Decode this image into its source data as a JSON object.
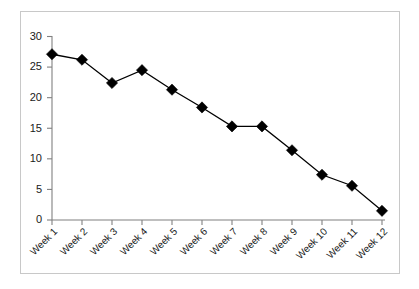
{
  "chart_data": {
    "type": "line",
    "title": "",
    "subtitle": "",
    "xlabel": "",
    "ylabel": "",
    "categories": [
      "Week 1",
      "Week 2",
      "Week 3",
      "Week 4",
      "Week 5",
      "Week 6",
      "Week 7",
      "Week 8",
      "Week 9",
      "Week 10",
      "Week 11",
      "Week 12"
    ],
    "values": [
      27.1,
      26.2,
      22.4,
      24.5,
      21.3,
      18.4,
      15.3,
      15.3,
      11.4,
      7.4,
      5.6,
      1.5
    ],
    "series": [
      {
        "name": "",
        "values": [
          27.1,
          26.2,
          22.4,
          24.5,
          21.3,
          18.4,
          15.3,
          15.3,
          11.4,
          7.4,
          5.6,
          1.5
        ]
      }
    ],
    "ylim": [
      0,
      30
    ],
    "yticks": [
      0,
      5,
      10,
      15,
      20,
      25,
      30
    ],
    "ytick_labels": [
      "0",
      "5",
      "10",
      "15",
      "20",
      "25",
      "30"
    ],
    "grid": false,
    "legend": false,
    "legend_position": "none",
    "marker": "diamond",
    "marker_color": "#000000",
    "line_color": "#000000",
    "axis_color": "#808080",
    "background_color": "#ffffff",
    "border_color": "#c8c8c8",
    "xtick_rotation": 45,
    "annotations": []
  }
}
